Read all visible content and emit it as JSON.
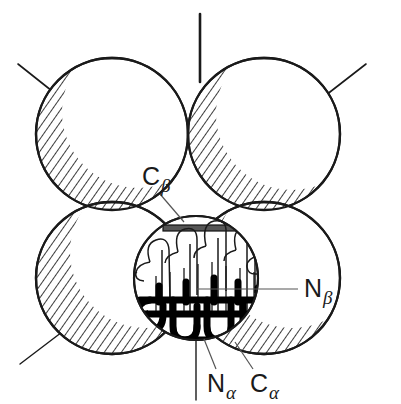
{
  "figure": {
    "background_color": "#ffffff",
    "stroke_color": "#1a1a1a",
    "hatch_color": "#1a1a1a",
    "chain_fill_color": "#000000",
    "width": 401,
    "height": 404
  },
  "labels": {
    "c_beta": {
      "base": "C",
      "sub": "β",
      "x": 142,
      "y": 185
    },
    "n_beta": {
      "base": "N",
      "sub": "β",
      "x": 304,
      "y": 295
    },
    "n_alpha": {
      "base": "N",
      "sub": "α",
      "x": 209,
      "y": 390
    },
    "c_alpha": {
      "base": "C",
      "sub": "α",
      "x": 253,
      "y": 390
    }
  },
  "circles": {
    "large_radius": 76,
    "small_radius": 62,
    "positions": [
      {
        "name": "top-left",
        "cx": 112,
        "cy": 134
      },
      {
        "name": "top-right",
        "cx": 264,
        "cy": 134
      },
      {
        "name": "bottom-left",
        "cx": 112,
        "cy": 278
      },
      {
        "name": "bottom-right",
        "cx": 264,
        "cy": 278
      },
      {
        "name": "center",
        "cx": 196,
        "cy": 278
      }
    ]
  },
  "axes": {
    "vertical_top": {
      "x": 200,
      "y1": 14,
      "y2": 80
    },
    "vertical_bottom": {
      "x": 196,
      "y1": 330,
      "y2": 400
    },
    "diag_top_left": {
      "x1": 18,
      "y1": 64,
      "x2": 108,
      "y2": 136
    },
    "diag_top_right": {
      "x1": 366,
      "y1": 64,
      "x2": 272,
      "y2": 136
    },
    "diag_bottom_left": {
      "x1": 22,
      "y1": 362,
      "x2": 64,
      "y2": 330
    }
  },
  "leaders": {
    "c_beta": {
      "x1": 160,
      "y1": 193,
      "x2": 182,
      "y2": 215
    },
    "n_beta": {
      "x1": 297,
      "y1": 288,
      "x2": 196,
      "y2": 288
    },
    "n_alpha": {
      "x1": 216,
      "y1": 370,
      "x2": 203,
      "y2": 340
    },
    "c_alpha": {
      "x1": 252,
      "y1": 370,
      "x2": 236,
      "y2": 343
    }
  }
}
